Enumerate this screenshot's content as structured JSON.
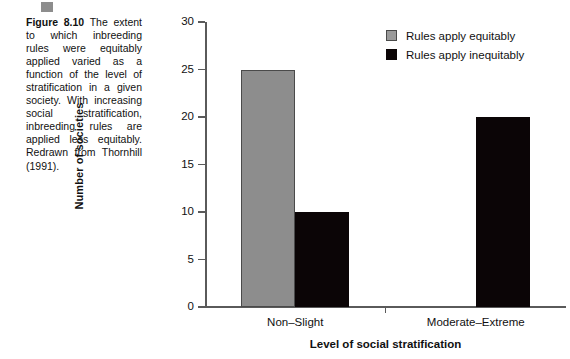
{
  "figure": {
    "marker_icon": "gray-square-marker",
    "label": "Figure 8.10",
    "caption": " The extent to which inbreeding rules were equitably applied varied as a function of the level of stratification in a given society. With increasing social stratification, inbreeding rules are applied less equitably. Redrawn from Thornhill (1991)."
  },
  "legend": {
    "position": "top-right",
    "entries": [
      {
        "label": "Rules apply equitably",
        "color": "#8d8d8d",
        "swatch_icon": "gray-square-swatch"
      },
      {
        "label": "Rules apply inequitably",
        "color": "#0b0506",
        "swatch_icon": "black-square-swatch"
      }
    ]
  },
  "chart_data": {
    "type": "bar",
    "title": "",
    "xlabel": "Level  of social stratification",
    "ylabel": "Number of societies",
    "categories": [
      "Non–Slight",
      "Moderate–Extreme"
    ],
    "series": [
      {
        "name": "Rules apply equitably",
        "color": "#8d8d8d",
        "values": [
          25,
          0
        ]
      },
      {
        "name": "Rules apply inequitably",
        "color": "#0b0506",
        "values": [
          10,
          20
        ]
      }
    ],
    "ylim": [
      0,
      30
    ],
    "yticks": [
      0,
      5,
      10,
      15,
      20,
      25,
      30
    ],
    "ytick_labels": [
      "0",
      "5",
      "10",
      "15",
      "20",
      "25",
      "30"
    ],
    "grid": false,
    "legend_position": "top-right"
  }
}
